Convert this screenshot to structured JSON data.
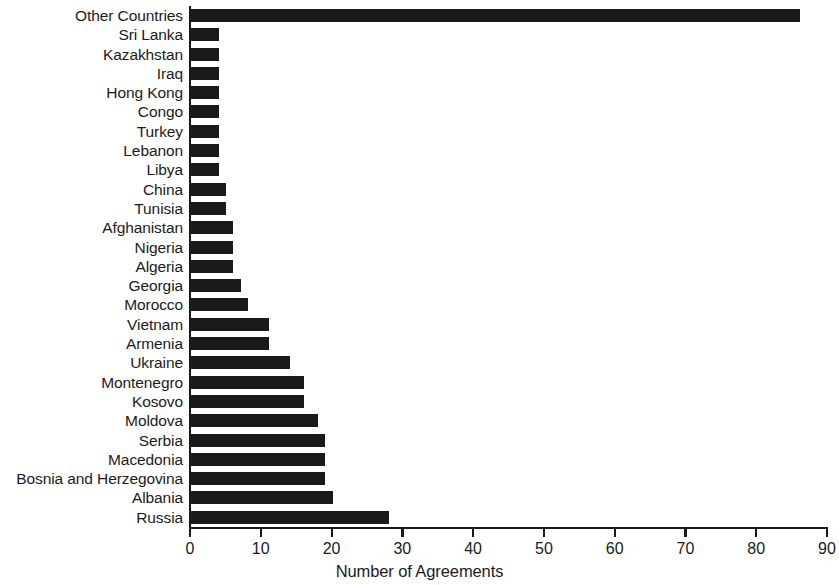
{
  "chart_data": {
    "type": "bar",
    "orientation": "horizontal",
    "title": "",
    "xlabel": "Number of Agreements",
    "ylabel": "",
    "xlim": [
      0,
      90
    ],
    "xticks": [
      0,
      10,
      20,
      30,
      40,
      50,
      60,
      70,
      80,
      90
    ],
    "xtick_labels": [
      "0",
      "10",
      "20",
      "30",
      "40",
      "50",
      "60",
      "70",
      "80",
      "90"
    ],
    "grid": false,
    "legend": null,
    "bar_color": "#151515",
    "categories": [
      "Other Countries",
      "Sri Lanka",
      "Kazakhstan",
      "Iraq",
      "Hong Kong",
      "Congo",
      "Turkey",
      "Lebanon",
      "Libya",
      "China",
      "Tunisia",
      "Afghanistan",
      "Nigeria",
      "Algeria",
      "Georgia",
      "Morocco",
      "Vietnam",
      "Armenia",
      "Ukraine",
      "Montenegro",
      "Kosovo",
      "Moldova",
      "Serbia",
      "Macedonia",
      "Bosnia and Herzegovina",
      "Albania",
      "Russia"
    ],
    "values": [
      86,
      4,
      4,
      4,
      4,
      4,
      4,
      4,
      4,
      5,
      5,
      6,
      6,
      6,
      7,
      8,
      11,
      11,
      14,
      16,
      16,
      18,
      19,
      19,
      19,
      20,
      28
    ]
  }
}
